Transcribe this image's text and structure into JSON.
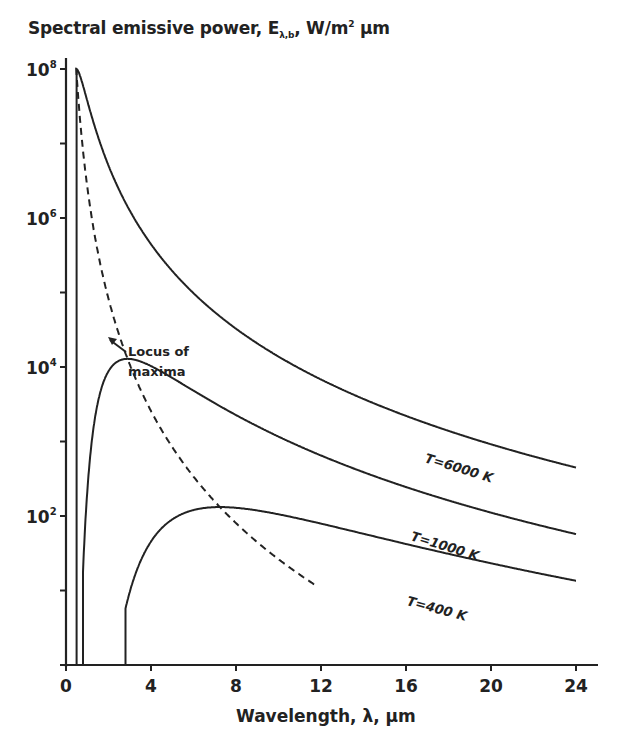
{
  "chart_data": {
    "type": "line",
    "title_parts": {
      "main": "Spectral emissive power, E",
      "sub": "λ,b",
      "rest": ", W/m",
      "sup": "2",
      "unit": " μm"
    },
    "xlabel": "Wavelength, λ, μm",
    "ylabel": "Spectral emissive power, Eλb, W/m² μm",
    "xscale": "linear",
    "yscale": "log",
    "xlim": [
      0,
      24
    ],
    "ylim": [
      1,
      100000000
    ],
    "xticks": [
      0,
      4,
      8,
      12,
      16,
      20,
      24
    ],
    "yticks": [
      {
        "base": "10",
        "exp": "8",
        "value": 100000000
      },
      {
        "base": "10",
        "exp": "6",
        "value": 1000000
      },
      {
        "base": "10",
        "exp": "4",
        "value": 10000
      },
      {
        "base": "10",
        "exp": "2",
        "value": 100
      }
    ],
    "grid": false,
    "legend": "none (inline labels)",
    "series": [
      {
        "name": "T=6000 K",
        "T": 6000,
        "style": "solid",
        "x": [
          0.5,
          1,
          2,
          4,
          8,
          12,
          16,
          20,
          24
        ],
        "y": [
          100000000,
          36000000,
          5000000,
          440000,
          31000,
          6600,
          2200,
          920,
          450
        ]
      },
      {
        "name": "T=1000 K",
        "T": 1000,
        "style": "solid",
        "x": [
          0.8,
          1,
          2,
          2.9,
          4,
          8,
          12,
          16,
          20,
          24
        ],
        "y": [
          2,
          43,
          9000,
          12800,
          10300,
          2200,
          580,
          210,
          90,
          45
        ]
      },
      {
        "name": "T=400 K",
        "T": 400,
        "style": "solid",
        "x": [
          2.8,
          4,
          6,
          7.2,
          8,
          12,
          16,
          20,
          24
        ],
        "y": [
          1,
          10,
          104,
          136,
          130,
          75,
          40,
          22,
          14
        ]
      },
      {
        "name": "Locus of maxima",
        "style": "dashed",
        "relation": "λmax T = 2898 μm·K",
        "x": [
          0.48,
          1,
          2,
          2.9,
          4,
          7.2,
          10,
          11.8
        ],
        "y": [
          100000000,
          4100000,
          130000,
          12800,
          2700,
          136,
          35,
          1
        ]
      }
    ],
    "annotations": [
      {
        "text": "T=6000 K",
        "near_x": 17.5
      },
      {
        "text": "T=1000 K",
        "near_x": 16.5
      },
      {
        "text": "T=400 K",
        "near_x": 16
      },
      {
        "text_line1": "Locus of",
        "text_line2": "maxima",
        "arrow_to_x": 2.0
      }
    ]
  },
  "labels": {
    "title_main": "Spectral emissive power, E",
    "title_sub": "λ,b",
    "title_rest": ", W/m",
    "title_sup": "2",
    "title_unit": " μm",
    "xlabel": "Wavelength, λ, μm",
    "locus_line1": "Locus of",
    "locus_line2": "maxima",
    "t6000": "T=6000 K",
    "t1000": "T=1000 K",
    "t400": "T=400 K"
  },
  "colors": {
    "ink": "#222222",
    "background": "#ffffff"
  }
}
